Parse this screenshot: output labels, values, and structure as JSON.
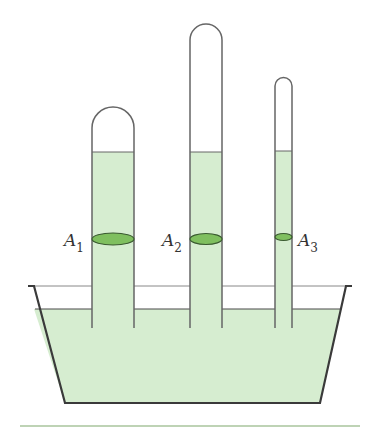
{
  "diagram": {
    "colors": {
      "liquid": "#d6edd0",
      "cross_section": "#7fbf5f",
      "outline": "#3a3a3a",
      "tube_outline": "#666666",
      "baseline": "#a8c49c"
    },
    "labels": {
      "a1": {
        "letter": "A",
        "sub": "1"
      },
      "a2": {
        "letter": "A",
        "sub": "2"
      },
      "a3": {
        "letter": "A",
        "sub": "3"
      }
    },
    "tubes": [
      {
        "name": "tube-1",
        "label": "A1",
        "width": "wide",
        "height": "short"
      },
      {
        "name": "tube-2",
        "label": "A2",
        "width": "medium",
        "height": "tall"
      },
      {
        "name": "tube-3",
        "label": "A3",
        "width": "narrow",
        "height": "medium"
      }
    ]
  }
}
